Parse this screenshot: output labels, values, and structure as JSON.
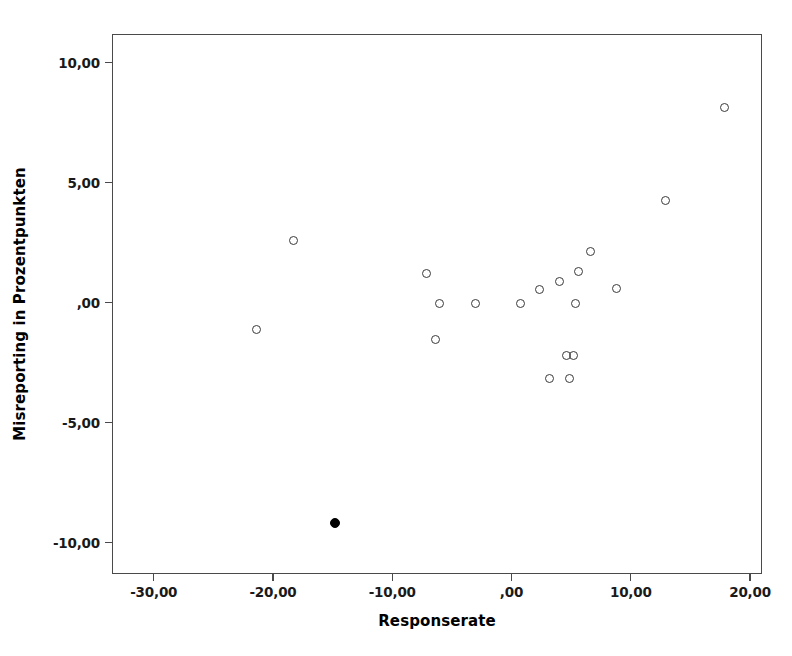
{
  "chart_data": {
    "type": "scatter",
    "title": "",
    "xlabel": "Responserate",
    "ylabel": "Misreporting in Prozentpunkten",
    "xlim": [
      -33.5,
      21.0
    ],
    "ylim": [
      -11.3,
      11.2
    ],
    "grid": false,
    "legend": null,
    "xticks": [
      -30,
      -20,
      -10,
      0,
      10,
      20
    ],
    "xticklabels": [
      "-30,00",
      "-20,00",
      "-10,00",
      ",00",
      "10,00",
      "20,00"
    ],
    "yticks": [
      10,
      5,
      0,
      -5,
      -10
    ],
    "yticklabels": [
      "10,00",
      "5,00",
      ",00",
      "-5,00",
      "-10,00"
    ],
    "marker_styles": {
      "open": "open-circle",
      "highlighted": "filled-circle"
    },
    "points": [
      {
        "x": 17.8,
        "y": 8.2,
        "style": "open"
      },
      {
        "x": 12.8,
        "y": 4.3,
        "style": "open"
      },
      {
        "x": -18.4,
        "y": 2.65,
        "style": "open"
      },
      {
        "x": 6.5,
        "y": 2.2,
        "style": "open"
      },
      {
        "x": 5.5,
        "y": 1.35,
        "style": "open"
      },
      {
        "x": 3.9,
        "y": 0.95,
        "style": "open"
      },
      {
        "x": 8.7,
        "y": 0.65,
        "style": "open"
      },
      {
        "x": 2.3,
        "y": 0.6,
        "style": "open"
      },
      {
        "x": -7.2,
        "y": 1.25,
        "style": "open"
      },
      {
        "x": -6.1,
        "y": 0.0,
        "style": "open"
      },
      {
        "x": -3.1,
        "y": 0.0,
        "style": "open"
      },
      {
        "x": 0.7,
        "y": 0.0,
        "style": "open"
      },
      {
        "x": 5.3,
        "y": 0.0,
        "style": "open"
      },
      {
        "x": -21.5,
        "y": -1.05,
        "style": "open"
      },
      {
        "x": -6.5,
        "y": -1.5,
        "style": "open"
      },
      {
        "x": 4.5,
        "y": -2.15,
        "style": "open"
      },
      {
        "x": 5.1,
        "y": -2.15,
        "style": "open"
      },
      {
        "x": 3.1,
        "y": -3.1,
        "style": "open"
      },
      {
        "x": 4.8,
        "y": -3.1,
        "style": "open"
      },
      {
        "x": -14.9,
        "y": -9.15,
        "style": "highlighted"
      }
    ]
  }
}
